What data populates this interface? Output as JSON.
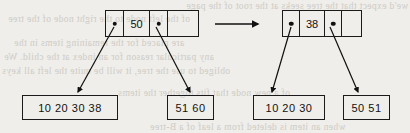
{
  "figure": {
    "caption": "",
    "background_color": "#efeeea",
    "ink_color": "#1a1a1a"
  },
  "bleed_text": [
    {
      "text": "we'd expect that the tree seeks at the root of the page"
    },
    {
      "text": "of the left node to the right node of the tree"
    },
    {
      "text": "are placed for the remaining items in the"
    },
    {
      "text": "any particular reason for an index at the child. We"
    },
    {
      "text": "obliged to use the tree, it will be quite the left all keys"
    },
    {
      "text": "of a new node that fits together the items"
    },
    {
      "text": "when an item is deleted from a leaf of a B-tree"
    }
  ],
  "before": {
    "label": "before-split-tree",
    "root": {
      "cells": [
        {
          "type": "pointer",
          "value": ""
        },
        {
          "type": "key",
          "value": "50"
        },
        {
          "type": "pointer",
          "value": ""
        },
        {
          "type": "empty",
          "value": ""
        }
      ]
    },
    "leaves": [
      {
        "name": "left-leaf",
        "values": "10  20  30  38"
      },
      {
        "name": "right-leaf",
        "values": "51  60"
      }
    ]
  },
  "transition": {
    "name": "transition-arrow",
    "label": ""
  },
  "after": {
    "label": "after-split-tree",
    "root": {
      "cells": [
        {
          "type": "pointer",
          "value": ""
        },
        {
          "type": "key",
          "value": "38"
        },
        {
          "type": "pointer",
          "value": ""
        },
        {
          "type": "empty",
          "value": ""
        }
      ]
    },
    "leaves": [
      {
        "name": "left-leaf",
        "values": "10  20  30"
      },
      {
        "name": "right-leaf",
        "values": "50  51"
      }
    ]
  }
}
